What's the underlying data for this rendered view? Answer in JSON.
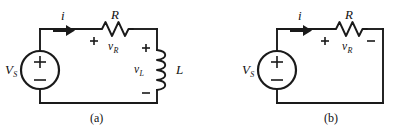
{
  "figure": {
    "background_color": "#ffffff",
    "line_color": "#1a1a1a"
  },
  "circuits": [
    {
      "caption": "(a)",
      "source": {
        "label": "V",
        "subscript": "S",
        "plus": "+",
        "minus": "−",
        "type": "independent-voltage-source"
      },
      "current": {
        "label": "i",
        "direction": "right"
      },
      "components": [
        {
          "type": "resistor",
          "label": "R",
          "voltage_label": "v",
          "voltage_subscript": "R",
          "plus": "+",
          "minus": ""
        },
        {
          "type": "inductor",
          "label": "L",
          "voltage_label": "v",
          "voltage_subscript": "L",
          "plus": "+",
          "minus": "−"
        }
      ]
    },
    {
      "caption": "(b)",
      "source": {
        "label": "V",
        "subscript": "S",
        "plus": "+",
        "minus": "−",
        "type": "independent-voltage-source"
      },
      "current": {
        "label": "i",
        "direction": "right"
      },
      "components": [
        {
          "type": "resistor",
          "label": "R",
          "voltage_label": "v",
          "voltage_subscript": "R",
          "plus": "+",
          "minus": "−"
        }
      ]
    }
  ]
}
